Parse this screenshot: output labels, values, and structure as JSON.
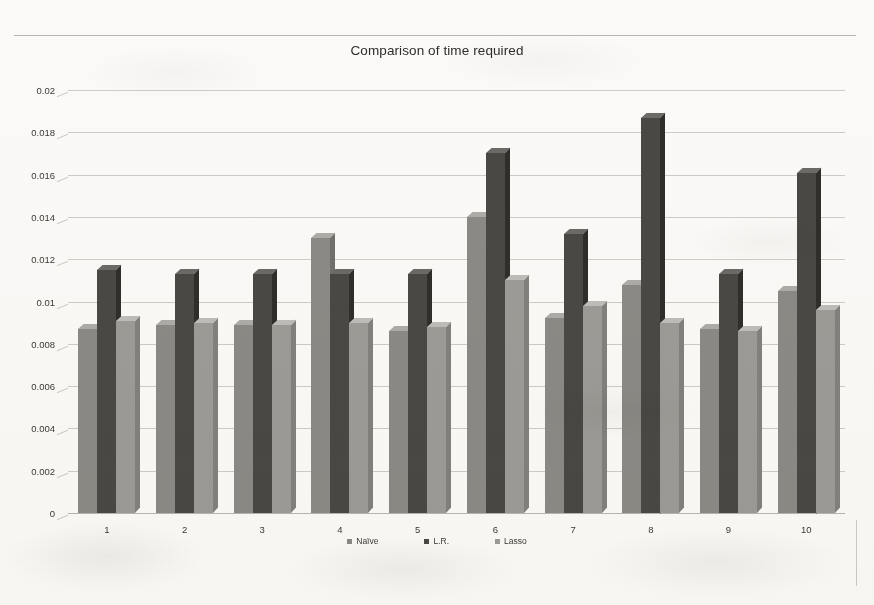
{
  "chart_data": {
    "type": "bar",
    "title": "Comparison of time required",
    "xlabel": "",
    "ylabel": "",
    "categories": [
      "1",
      "2",
      "3",
      "4",
      "5",
      "6",
      "7",
      "8",
      "9",
      "10"
    ],
    "series": [
      {
        "name": "Naïve",
        "color": "#8c8a86",
        "values": [
          0.0087,
          0.0089,
          0.0089,
          0.013,
          0.0086,
          0.014,
          0.0092,
          0.0108,
          0.0087,
          0.0105
        ]
      },
      {
        "name": "L.R.",
        "color": "#4a4845",
        "values": [
          0.0115,
          0.0113,
          0.0113,
          0.0113,
          0.0113,
          0.017,
          0.0132,
          0.0187,
          0.0113,
          0.0161
        ]
      },
      {
        "name": "Lasso",
        "color": "#9d9b97",
        "values": [
          0.0091,
          0.009,
          0.0089,
          0.009,
          0.0088,
          0.011,
          0.0098,
          0.009,
          0.0086,
          0.0096
        ]
      }
    ],
    "ylim": [
      0,
      0.02
    ],
    "yticks": [
      "0",
      "0.002",
      "0.004",
      "0.006",
      "0.008",
      "0.01",
      "0.012",
      "0.014",
      "0.016",
      "0.018",
      "0.02"
    ],
    "ytick_values": [
      0,
      0.002,
      0.004,
      0.006,
      0.008,
      0.01,
      0.012,
      0.014,
      0.016,
      0.018,
      0.02
    ],
    "grid": true,
    "legend_position": "bottom"
  }
}
